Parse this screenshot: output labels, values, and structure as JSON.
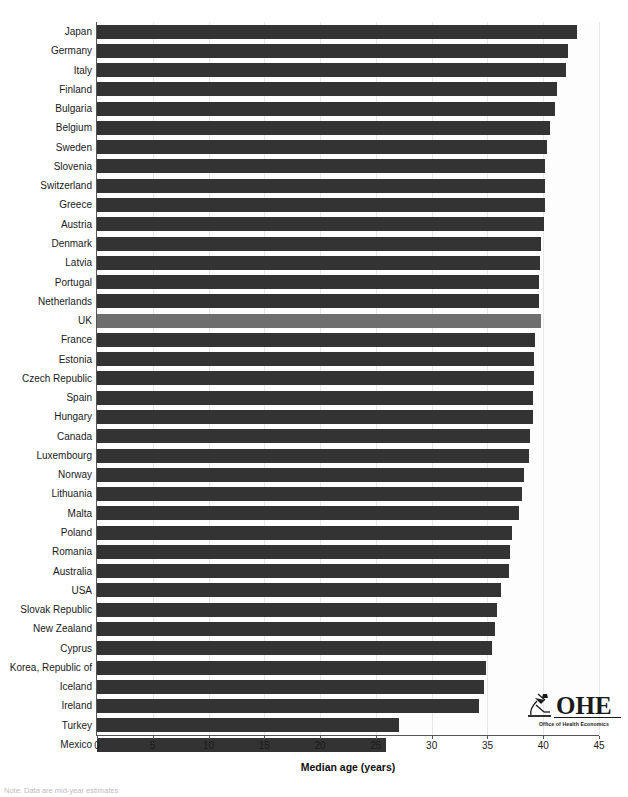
{
  "figure": {
    "background_color": "#ffffff",
    "bar_color": "#333333",
    "highlight_color": "#6e6e6e",
    "highlight_category": "UK",
    "grid_color": "#e7e7e7",
    "axis_color": "#555555"
  },
  "logo": {
    "mark": "microscope-icon",
    "wordmark": "OHE",
    "caption": "Office of Health Economics"
  },
  "footnote": {
    "text": "Note: Data are mid-year estimates"
  },
  "chart_data": {
    "type": "bar",
    "orientation": "horizontal",
    "title": "",
    "xlabel": "Median age (years)",
    "ylabel": "",
    "xlim": [
      0,
      45
    ],
    "xticks": [
      0,
      5,
      10,
      15,
      20,
      25,
      30,
      35,
      40,
      45
    ],
    "xtick_labels": [
      "0",
      "5",
      "10",
      "15",
      "20",
      "25",
      "30",
      "35",
      "40",
      "45"
    ],
    "grid": "vertical",
    "legend": "none",
    "categories": [
      "Japan",
      "Germany",
      "Italy",
      "Finland",
      "Bulgaria",
      "Belgium",
      "Sweden",
      "Slovenia",
      "Switzerland",
      "Greece",
      "Austria",
      "Denmark",
      "Latvia",
      "Portugal",
      "Netherlands",
      "UK",
      "France",
      "Estonia",
      "Czech Republic",
      "Spain",
      "Hungary",
      "Canada",
      "Luxembourg",
      "Norway",
      "Lithuania",
      "Malta",
      "Poland",
      "Romania",
      "Australia",
      "USA",
      "Slovak Republic",
      "New Zealand",
      "Cyprus",
      "Korea, Republic of",
      "Iceland",
      "Ireland",
      "Turkey",
      "Mexico"
    ],
    "values": [
      43.0,
      42.2,
      42.0,
      41.2,
      41.1,
      40.6,
      40.3,
      40.2,
      40.2,
      40.2,
      40.1,
      39.8,
      39.7,
      39.6,
      39.6,
      39.8,
      39.3,
      39.2,
      39.2,
      39.1,
      39.1,
      38.8,
      38.7,
      38.3,
      38.1,
      37.8,
      37.2,
      37.0,
      36.9,
      36.2,
      35.9,
      35.7,
      35.4,
      34.9,
      34.7,
      34.2,
      27.1,
      25.9
    ]
  }
}
